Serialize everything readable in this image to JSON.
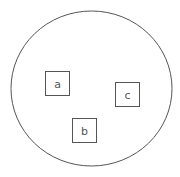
{
  "diagram": {
    "container": {
      "shape": "circle",
      "cx": 91.5,
      "cy": 88.5,
      "rx": 80.5,
      "ry": 77.5,
      "stroke": "#555555"
    },
    "boxes": [
      {
        "label": "a",
        "x": 45.5,
        "y": 71.5,
        "w": 24,
        "h": 24
      },
      {
        "label": "b",
        "x": 72.5,
        "y": 118.5,
        "w": 24,
        "h": 24
      },
      {
        "label": "c",
        "x": 115.5,
        "y": 82.5,
        "w": 24,
        "h": 24
      }
    ],
    "stroke_color": "#555555"
  }
}
